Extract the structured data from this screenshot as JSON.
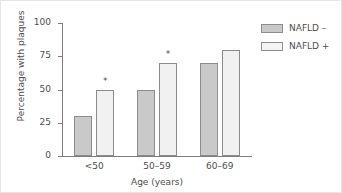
{
  "chart_data": {
    "type": "bar",
    "title": "",
    "subtitle": "",
    "xlabel": "Age (years)",
    "ylabel": "Percentage with plaques",
    "categories": [
      "<50",
      "50–59",
      "60–69"
    ],
    "ylim": [
      0,
      100
    ],
    "yticks": [
      0,
      25,
      50,
      75,
      100
    ],
    "ytick_labels": [
      "0",
      "25",
      "50",
      "75",
      "100"
    ],
    "grid": false,
    "legend_position": "right-top",
    "series": [
      {
        "name": "NAFLD –",
        "color": "#c9c9c9",
        "values": [
          30,
          50,
          70
        ]
      },
      {
        "name": "NAFLD +",
        "color": "#f1f1f1",
        "values": [
          50,
          70,
          80
        ]
      }
    ],
    "annotations": [
      {
        "text": "*",
        "category": "<50",
        "series": "NAFLD +",
        "value": 50
      },
      {
        "text": "*",
        "category": "50–59",
        "series": "NAFLD +",
        "value": 70
      }
    ]
  },
  "legend": {
    "items": [
      {
        "label": "NAFLD –",
        "swatch": "dark"
      },
      {
        "label": "NAFLD +",
        "swatch": "light"
      }
    ]
  }
}
